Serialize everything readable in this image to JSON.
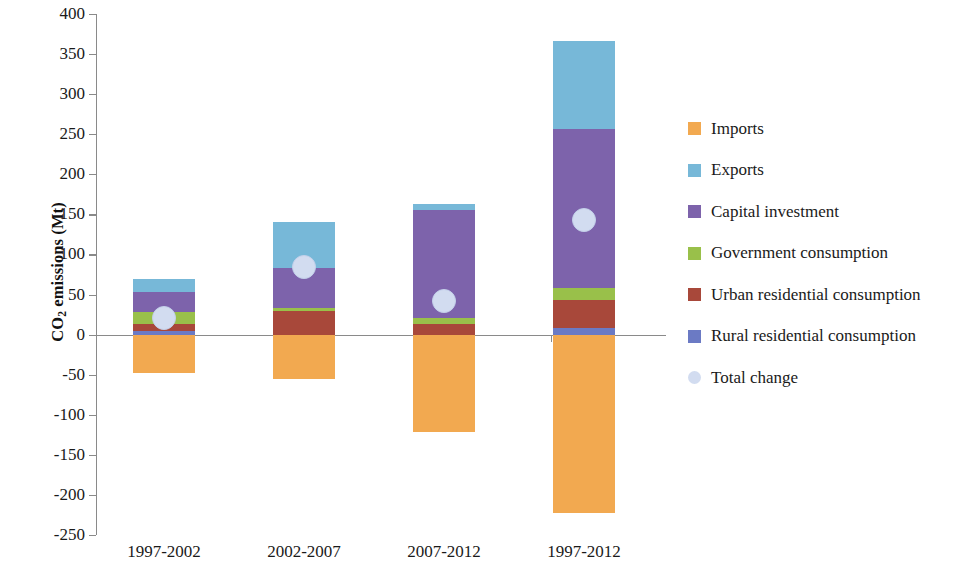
{
  "chart_data": {
    "type": "bar",
    "subtype": "stacked-bar-with-overlay-marker",
    "title": "",
    "xlabel": "",
    "ylabel": "CO2 emissions (Mt)",
    "ylabel_rich": {
      "pre": "CO",
      "sub": "2",
      "post": " emissions (Mt)"
    },
    "ylim": [
      -250,
      400
    ],
    "ytick_step": 50,
    "yticks": [
      400,
      350,
      300,
      250,
      200,
      150,
      100,
      50,
      0,
      -50,
      -100,
      -150,
      -200,
      -250
    ],
    "ytick_labels": [
      "400",
      "350",
      "300",
      "250",
      "200",
      "150",
      "100",
      "50",
      "0",
      "-50",
      "-100",
      "-150",
      "-200",
      "-250"
    ],
    "grid": false,
    "legend_position": "right",
    "categories": [
      "1997-2002",
      "2002-2007",
      "2007-2012",
      "1997-2012"
    ],
    "series": [
      {
        "name": "Imports",
        "color": "#F2A950",
        "values": [
          -48,
          -56,
          -121,
          -222
        ]
      },
      {
        "name": "Exports",
        "color": "#77B8D8",
        "values": [
          17,
          57,
          7,
          110
        ]
      },
      {
        "name": "Capital investment",
        "color": "#7D63AB",
        "values": [
          25,
          50,
          135,
          198
        ]
      },
      {
        "name": "Government consumption",
        "color": "#99C04A",
        "values": [
          15,
          3,
          8,
          15
        ]
      },
      {
        "name": "Urban residential consumption",
        "color": "#A8483A",
        "values": [
          8,
          30,
          13,
          35
        ]
      },
      {
        "name": "Rural residential consumption",
        "color": "#6B7AC4",
        "values": [
          5,
          0,
          0,
          8
        ]
      }
    ],
    "overlay": {
      "name": "Total change",
      "type": "scatter",
      "color": "#D2DCF0",
      "marker": "circle",
      "values": [
        21,
        84,
        42,
        143
      ]
    },
    "stack_order_bottom_to_top": [
      "Rural residential consumption",
      "Urban residential consumption",
      "Government consumption",
      "Capital investment",
      "Exports"
    ],
    "bar_tops": [
      70,
      140,
      163,
      366
    ],
    "bar_bottoms": [
      -48,
      -56,
      -121,
      -222
    ]
  },
  "legend": {
    "items": [
      {
        "label": "Imports",
        "color": "#F2A950",
        "marker": "square"
      },
      {
        "label": "Exports",
        "color": "#77B8D8",
        "marker": "square"
      },
      {
        "label": "Capital investment",
        "color": "#7D63AB",
        "marker": "square"
      },
      {
        "label": "Government consumption",
        "color": "#99C04A",
        "marker": "square"
      },
      {
        "label": "Urban residential consumption",
        "color": "#A8483A",
        "marker": "square"
      },
      {
        "label": "Rural residential consumption",
        "color": "#6B7AC4",
        "marker": "square"
      },
      {
        "label": "Total change",
        "color": "#D2DCF0",
        "marker": "circle"
      }
    ]
  },
  "axis": {
    "line_color": "#8a8a8a"
  }
}
